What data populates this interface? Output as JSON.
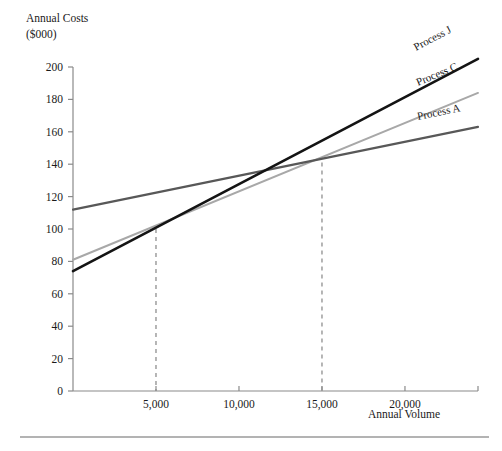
{
  "chart_data": {
    "type": "line",
    "title": "",
    "ylabel_line1": "Annual Costs",
    "ylabel_line2": "($000)",
    "xlabel": "Annual Volume",
    "xlim": [
      0,
      24400
    ],
    "ylim": [
      0,
      200
    ],
    "grid": false,
    "legend_position": "inline-right-of-line-ends",
    "y_ticks": [
      {
        "value": 0,
        "label": "0"
      },
      {
        "value": 20,
        "label": "20"
      },
      {
        "value": 40,
        "label": "40"
      },
      {
        "value": 60,
        "label": "60"
      },
      {
        "value": 80,
        "label": "80"
      },
      {
        "value": 100,
        "label": "100"
      },
      {
        "value": 120,
        "label": "120"
      },
      {
        "value": 140,
        "label": "140"
      },
      {
        "value": 160,
        "label": "160"
      },
      {
        "value": 180,
        "label": "180"
      },
      {
        "value": 200,
        "label": "200"
      }
    ],
    "x_ticks": [
      {
        "value": 5000,
        "label": "5,000"
      },
      {
        "value": 10000,
        "label": "10,000"
      },
      {
        "value": 15000,
        "label": "15,000"
      },
      {
        "value": 20000,
        "label": "20,000"
      }
    ],
    "series": [
      {
        "name": "Process J",
        "label": "Process J",
        "color": "#141414",
        "width": 2.6,
        "points": [
          {
            "x": 0,
            "y": 74
          },
          {
            "x": 24400,
            "y": 205
          }
        ]
      },
      {
        "name": "Process C",
        "label": "Process C",
        "color": "#a8a8a8",
        "width": 2.0,
        "points": [
          {
            "x": 0,
            "y": 81
          },
          {
            "x": 24400,
            "y": 184
          }
        ]
      },
      {
        "name": "Process A",
        "label": "Process A",
        "color": "#585858",
        "width": 2.2,
        "points": [
          {
            "x": 0,
            "y": 112
          },
          {
            "x": 24400,
            "y": 163
          }
        ]
      }
    ],
    "annotations": [
      {
        "name": "breakeven-j-c",
        "type": "vertical-dashed",
        "x": 5000,
        "y_top": 100,
        "y_bottom": 0,
        "color": "#8f8f8f"
      },
      {
        "name": "breakeven-c-a",
        "type": "vertical-dashed",
        "x": 15000,
        "y_top": 141,
        "y_bottom": 0,
        "color": "#8f8f8f"
      }
    ]
  },
  "footer": {
    "rule_color": "#9a9a9a"
  }
}
